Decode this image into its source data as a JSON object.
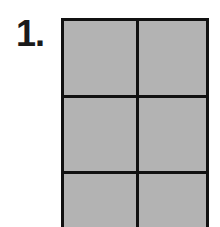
{
  "figure": {
    "label": "1.",
    "grid": {
      "columns": 2,
      "rows_visible": 3,
      "fill_color": "#b3b3b3",
      "line_color": "#111111",
      "cells": [
        {
          "row": 1,
          "col": 1
        },
        {
          "row": 1,
          "col": 2
        },
        {
          "row": 2,
          "col": 1
        },
        {
          "row": 2,
          "col": 2
        },
        {
          "row": 3,
          "col": 1
        },
        {
          "row": 3,
          "col": 2
        }
      ]
    }
  }
}
